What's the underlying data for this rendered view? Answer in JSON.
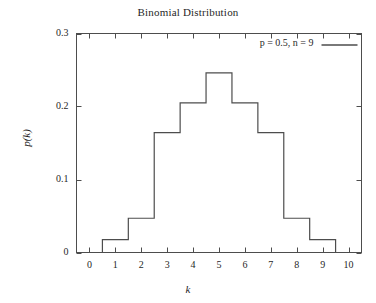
{
  "chart_data": {
    "type": "bar",
    "title": "Binomial Distribution",
    "xlabel": "k",
    "ylabel": "p(k)",
    "style": "step-histogram",
    "grid": false,
    "legend_position": "top-right",
    "legend": [
      {
        "label": "p = 0.5, n = 9",
        "sample": "line"
      }
    ],
    "categories": [
      "0",
      "1",
      "2",
      "3",
      "4",
      "5",
      "6",
      "7",
      "8",
      "9",
      "10"
    ],
    "x": [
      0,
      1,
      2,
      3,
      4,
      5,
      6,
      7,
      8,
      9,
      10
    ],
    "values": [
      0.0,
      0.0176,
      0.0469,
      0.1641,
      0.2051,
      0.2461,
      0.2051,
      0.1641,
      0.0469,
      0.0176,
      0.0
    ],
    "series": [
      {
        "name": "p = 0.5, n = 9",
        "values": [
          0.0,
          0.0176,
          0.0469,
          0.1641,
          0.2051,
          0.2461,
          0.2051,
          0.1641,
          0.0469,
          0.0176,
          0.0
        ]
      }
    ],
    "xlim": [
      -0.5,
      10.5
    ],
    "ylim": [
      0,
      0.3
    ],
    "xticks": [
      0,
      1,
      2,
      3,
      4,
      5,
      6,
      7,
      8,
      9,
      10
    ],
    "xtick_labels": [
      "0",
      "1",
      "2",
      "3",
      "4",
      "5",
      "6",
      "7",
      "8",
      "9",
      "10"
    ],
    "yticks": [
      0,
      0.1,
      0.2,
      0.3
    ],
    "ytick_labels": [
      "0",
      "0.1",
      "0.2",
      "0.3"
    ],
    "colors": {
      "line": "#4d4d4d",
      "axis": "#4d4d4d",
      "text": "#1f1f1f",
      "background": "#ffffff"
    }
  }
}
